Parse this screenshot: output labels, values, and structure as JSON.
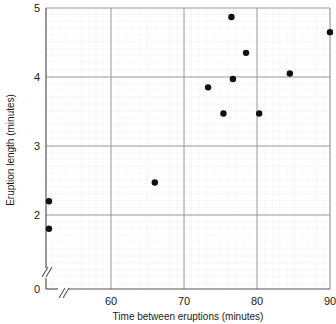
{
  "chart_data": {
    "type": "scatter",
    "title": "",
    "xlabel": "Time between eruptions (minutes)",
    "ylabel": "Eruption length (minutes)",
    "xlim": [
      50,
      90
    ],
    "ylim": [
      0,
      5
    ],
    "x_ticks": [
      "60",
      "70",
      "80",
      "90"
    ],
    "x_tick_values": [
      60,
      70,
      80,
      90
    ],
    "y_ticks": [
      "0",
      "2",
      "3",
      "4",
      "5"
    ],
    "y_tick_values": [
      0,
      2,
      3,
      4,
      5
    ],
    "grid": true,
    "minor_grid": true,
    "legend": "none",
    "axis_break_x": true,
    "axis_break_y": true,
    "marker": "filled-circle",
    "marker_color": "#111111",
    "points": [
      {
        "x": 51.5,
        "y": 2.2
      },
      {
        "x": 51.5,
        "y": 1.8
      },
      {
        "x": 66.0,
        "y": 2.47
      },
      {
        "x": 73.3,
        "y": 3.85
      },
      {
        "x": 75.4,
        "y": 3.47
      },
      {
        "x": 76.5,
        "y": 4.87
      },
      {
        "x": 76.7,
        "y": 3.97
      },
      {
        "x": 78.5,
        "y": 4.35
      },
      {
        "x": 80.3,
        "y": 3.47
      },
      {
        "x": 84.5,
        "y": 4.05
      },
      {
        "x": 90.0,
        "y": 4.65
      }
    ]
  },
  "colors": {
    "marker": "#111111",
    "major_grid": "#9a9a9a",
    "minor_grid": "#e6e0e6",
    "axis": "#555555",
    "text": "#1a1a1a"
  }
}
